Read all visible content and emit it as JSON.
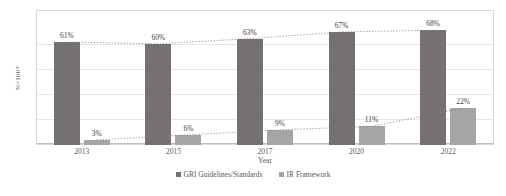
{
  "chart_data": {
    "type": "bar",
    "title": "",
    "subtitle": "",
    "xlabel": "Year",
    "ylabel": "N=100*",
    "categories": [
      "2013",
      "2015",
      "2017",
      "2020",
      "2022"
    ],
    "ylim": [
      0,
      80
    ],
    "grid": true,
    "legend_position": "bottom",
    "series": [
      {
        "name": "GRI Guidelines/Standards",
        "color": "#767171",
        "values": [
          61,
          60,
          63,
          67,
          68
        ],
        "labels": [
          "61%",
          "60%",
          "63%",
          "67%",
          "68%"
        ]
      },
      {
        "name": "IR Framework",
        "color": "#a5a5a5",
        "values": [
          3,
          6,
          9,
          11,
          22
        ],
        "labels": [
          "3%",
          "6%",
          "9%",
          "11%",
          "22%"
        ]
      }
    ],
    "trendlines": [
      {
        "name": "GRI Guidelines/Standards trend",
        "style": "dotted",
        "color": "#808080",
        "values": [
          61,
          60,
          63,
          67,
          68
        ]
      },
      {
        "name": "IR Framework trend",
        "style": "dotted",
        "color": "#808080",
        "values": [
          3,
          6,
          9,
          11,
          22
        ]
      }
    ]
  },
  "legend": {
    "items": [
      {
        "label": "GRI Guidelines/Standards",
        "color": "#767171"
      },
      {
        "label": "IR Framework",
        "color": "#a5a5a5"
      }
    ]
  },
  "colors": {
    "primary_bar": "#767171",
    "secondary_bar": "#a5a5a5",
    "gridline": "#e6e6e6",
    "frame": "#d9d9d9",
    "text": "#595959"
  }
}
